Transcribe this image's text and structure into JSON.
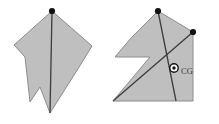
{
  "figure": {
    "background_color": "#ffffff",
    "shape_fill_color": "#bfbfbf",
    "shape_stroke_color": "#8c8c8c",
    "line_color": "#3c3c3c",
    "marker_color": "#111111",
    "panels": [
      {
        "name": "panel-left",
        "caption": "",
        "shape_name": "irregular-lamina-notched",
        "polygon_points": "52,11 92,46 81,64 50,113 40,87 30,102 25,57 14,45",
        "suspension_point": {
          "x": 52,
          "y": 11,
          "label": ""
        },
        "plumb_line": {
          "x1": 52,
          "y1": 11,
          "x2": 50,
          "y2": 113
        },
        "markers": [
          {
            "name": "suspension-dot-top",
            "x": 52,
            "y": 11
          }
        ]
      },
      {
        "name": "panel-right",
        "caption": "",
        "shape_name": "z-shaped-lamina",
        "polygon_points": "158,11 193,32 193,101 113,101 150,57 115,57 131,38",
        "suspension_point": {
          "x": 158,
          "y": 11,
          "label": ""
        },
        "second_suspension_point": {
          "x": 193,
          "y": 32,
          "label": ""
        },
        "plumb_line": {
          "x1": 158,
          "y1": 11,
          "x2": 176,
          "y2": 101
        },
        "second_plumb_line": {
          "x1": 113,
          "y1": 101,
          "x2": 193,
          "y2": 32
        },
        "markers": [
          {
            "name": "suspension-dot-top",
            "x": 158,
            "y": 11
          },
          {
            "name": "suspension-dot-right",
            "x": 193,
            "y": 32
          }
        ],
        "center_of_gravity": {
          "name": "center-of-gravity-marker",
          "x": 174,
          "y": 68,
          "label": "CG",
          "label_x": 181,
          "label_y": 74
        }
      }
    ]
  }
}
